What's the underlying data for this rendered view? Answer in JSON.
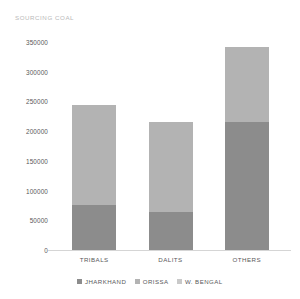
{
  "chart_data": {
    "type": "bar",
    "subtype": "stacked",
    "title": "SOURCING COAL",
    "xlabel": "",
    "ylabel": "",
    "categories": [
      "TRIBALS",
      "DALITS",
      "OTHERS"
    ],
    "series": [
      {
        "name": "JHARKHAND",
        "color": "#8c8c8c",
        "values": [
          76000,
          64000,
          215000
        ]
      },
      {
        "name": "ORISSA",
        "color": "#b3b3b3",
        "values": [
          168000,
          151000,
          126000
        ]
      },
      {
        "name": "W. BENGAL",
        "color": "#c9c9c9",
        "values": [
          0,
          0,
          0
        ]
      }
    ],
    "totals": [
      244000,
      215000,
      341000
    ],
    "ylim": [
      0,
      350000
    ],
    "ytick_step": 50000,
    "yticks": [
      {
        "value": 350000,
        "label": "350000"
      },
      {
        "value": 300000,
        "label": "300000"
      },
      {
        "value": 250000,
        "label": "250000"
      },
      {
        "value": 200000,
        "label": "200000"
      },
      {
        "value": 150000,
        "label": "150000"
      },
      {
        "value": 100000,
        "label": "100000"
      },
      {
        "value": 50000,
        "label": "50000"
      },
      {
        "value": 0,
        "label": "0"
      }
    ],
    "grid": false,
    "legend_position": "bottom",
    "colors": {
      "jharkhand": "#8c8c8c",
      "orissa": "#b3b3b3",
      "w_bengal": "#c9c9c9",
      "axis": "#d5d5d5",
      "tick_text": "#58585a",
      "title_text": "#b9b9b9",
      "background": "#ffffff"
    }
  }
}
